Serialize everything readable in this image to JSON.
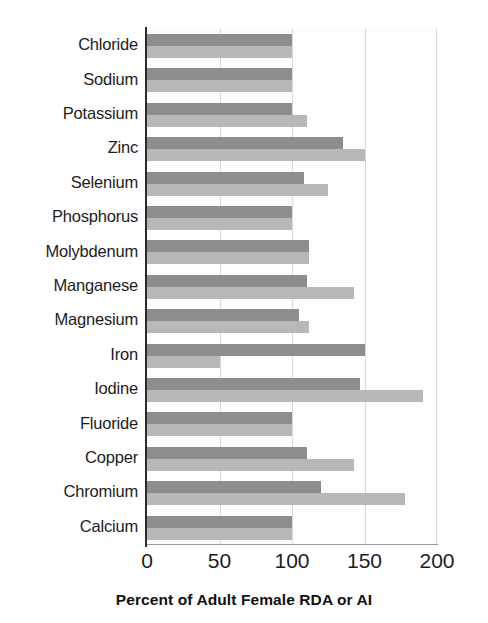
{
  "chart_data": {
    "type": "bar",
    "orientation": "horizontal",
    "title": "",
    "xlabel": "Percent of Adult Female RDA or AI",
    "ylabel": "",
    "xlim": [
      0,
      200
    ],
    "xticks": [
      0,
      50,
      100,
      150,
      200
    ],
    "xtick_labels": [
      "0",
      "50",
      "100",
      "150",
      "200"
    ],
    "grid": "vertical",
    "legend": "none",
    "categories": [
      "Chloride",
      "Sodium",
      "Potassium",
      "Zinc",
      "Selenium",
      "Phosphorus",
      "Molybdenum",
      "Manganese",
      "Magnesium",
      "Iron",
      "Iodine",
      "Fluoride",
      "Copper",
      "Chromium",
      "Calcium"
    ],
    "series": [
      {
        "name": "dark",
        "color": "#8d8d8d",
        "values": [
          100,
          100,
          100,
          135,
          108,
          100,
          112,
          110,
          105,
          150,
          147,
          100,
          110,
          120,
          100
        ]
      },
      {
        "name": "light",
        "color": "#b8b8b8",
        "values": [
          100,
          100,
          110,
          150,
          125,
          100,
          112,
          143,
          112,
          50,
          190,
          100,
          143,
          178,
          100
        ]
      }
    ]
  },
  "axis": {
    "x_title": "Percent of Adult Female RDA or AI"
  },
  "colors": {
    "bar_dark": "#8d8d8d",
    "bar_light": "#b8b8b8",
    "axis": "#2b2b2b",
    "grid": "#d8d8d8",
    "background": "#ffffff",
    "text": "#1d1d1d"
  }
}
